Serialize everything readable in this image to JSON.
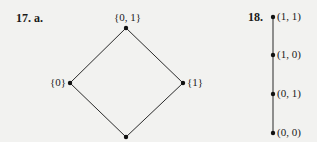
{
  "problem17": {
    "label": "17. a.",
    "diagram": {
      "type": "hasse",
      "nodes": [
        {
          "id": "top",
          "label": "{0, 1}"
        },
        {
          "id": "left",
          "label": "{0}"
        },
        {
          "id": "right",
          "label": "{1}"
        },
        {
          "id": "bottom",
          "label": ""
        }
      ],
      "edges": [
        [
          "bottom",
          "left"
        ],
        [
          "bottom",
          "right"
        ],
        [
          "left",
          "top"
        ],
        [
          "right",
          "top"
        ]
      ]
    }
  },
  "problem18": {
    "label": "18.",
    "diagram": {
      "type": "hasse-chain",
      "nodes": [
        {
          "label": "(1, 1)"
        },
        {
          "label": "(1, 0)"
        },
        {
          "label": "(0, 1)"
        },
        {
          "label": "(0, 0)"
        }
      ]
    }
  },
  "colors": {
    "background": "#f2f2f0",
    "ink": "#1a1a1a"
  }
}
